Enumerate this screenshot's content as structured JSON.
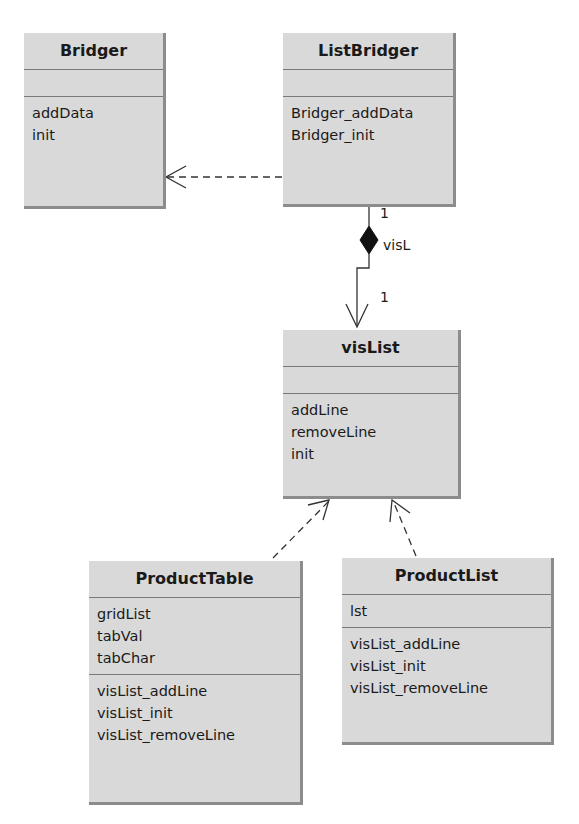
{
  "classes": {
    "bridger": {
      "name": "Bridger",
      "attributes": [],
      "operations": [
        "addData",
        "init"
      ]
    },
    "list_bridger": {
      "name": "ListBridger",
      "attributes": [],
      "operations": [
        "Bridger_addData",
        "Bridger_init"
      ]
    },
    "vis_list": {
      "name": "visList",
      "attributes": [],
      "operations": [
        "addLine",
        "removeLine",
        "init"
      ]
    },
    "product_table": {
      "name": "ProductTable",
      "attributes": [
        "gridList",
        "tabVal",
        "tabChar"
      ],
      "operations": [
        "visList_addLine",
        "visList_init",
        "visList_removeLine"
      ]
    },
    "product_list": {
      "name": "ProductList",
      "attributes": [
        "lst"
      ],
      "operations": [
        "visList_addLine",
        "visList_init",
        "visList_removeLine"
      ]
    }
  },
  "relations": {
    "realization_bridger": {
      "from": "ListBridger",
      "to": "Bridger",
      "style": "dashed-open-arrow"
    },
    "composition": {
      "from": "ListBridger",
      "to": "visList",
      "role": "visL",
      "multiplicity_source": "1",
      "multiplicity_target": "1"
    },
    "realization_table": {
      "from": "ProductTable",
      "to": "visList",
      "style": "dashed-open-arrow"
    },
    "realization_list": {
      "from": "ProductList",
      "to": "visList",
      "style": "dashed-open-arrow"
    }
  },
  "colors": {
    "box_fill": "#d9d9d9",
    "box_shadow": "#8c8c8c",
    "line": "#333333"
  }
}
